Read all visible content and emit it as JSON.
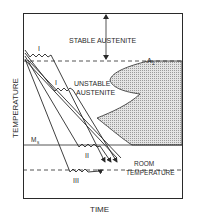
{
  "diagram": {
    "type": "TTT cooling diagram",
    "axes": {
      "y_label": "TEMPERATURE",
      "x_label": "TIME"
    },
    "regions": {
      "stable": "STABLE AUSTENITE",
      "unstable_line1": "UNSTABLE",
      "unstable_line2": "AUSTENITE"
    },
    "lines": {
      "a1": "A",
      "a1_sub": "1",
      "ms": "M",
      "ms_sub": "s",
      "room_line1": "ROOM",
      "room_line2": "TEMPERATURE"
    },
    "paths": {
      "path_1_upper": "I",
      "path_1_lower": "I",
      "path_2": "II",
      "path_3": "III"
    },
    "colors": {
      "ink": "#2a2a2a",
      "hatch": "#c8c8c8",
      "background": "#ffffff"
    }
  }
}
